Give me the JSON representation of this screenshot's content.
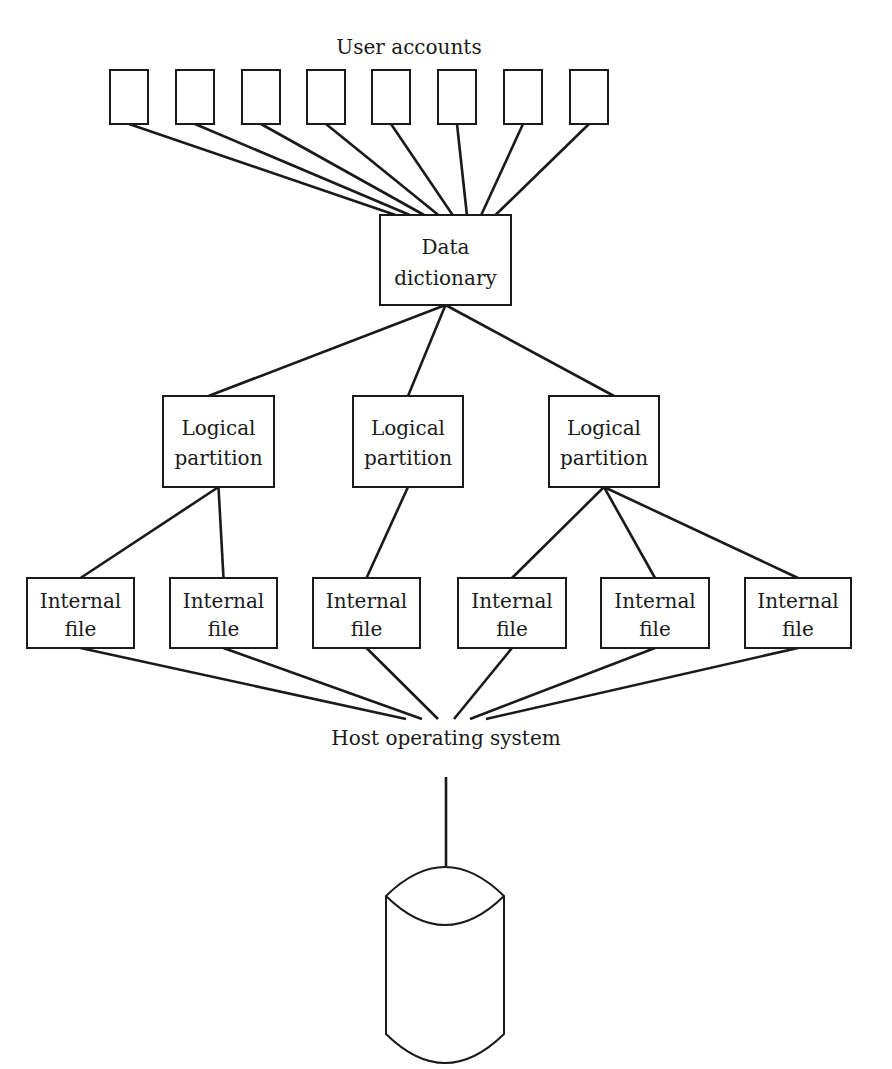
{
  "diagram": {
    "title": "User accounts",
    "user_accounts": {
      "label": "User accounts",
      "count": 8,
      "boxes": [
        {
          "x": 110,
          "y": 70,
          "w": 38,
          "h": 54
        },
        {
          "x": 176,
          "y": 70,
          "w": 38,
          "h": 54
        },
        {
          "x": 242,
          "y": 70,
          "w": 38,
          "h": 54
        },
        {
          "x": 307,
          "y": 70,
          "w": 38,
          "h": 54
        },
        {
          "x": 372,
          "y": 70,
          "w": 38,
          "h": 54
        },
        {
          "x": 438,
          "y": 70,
          "w": 38,
          "h": 54
        },
        {
          "x": 504,
          "y": 70,
          "w": 38,
          "h": 54
        },
        {
          "x": 570,
          "y": 70,
          "w": 38,
          "h": 54
        }
      ]
    },
    "data_dictionary": {
      "line1": "Data",
      "line2": "dictionary",
      "x": 380,
      "y": 215,
      "w": 131,
      "h": 90
    },
    "logical_partitions": [
      {
        "line1": "Logical",
        "line2": "partition",
        "x": 163,
        "y": 396,
        "w": 111,
        "h": 91
      },
      {
        "line1": "Logical",
        "line2": "partition",
        "x": 353,
        "y": 396,
        "w": 110,
        "h": 91
      },
      {
        "line1": "Logical",
        "line2": "partition",
        "x": 549,
        "y": 396,
        "w": 110,
        "h": 91
      }
    ],
    "internal_files": [
      {
        "line1": "Internal",
        "line2": "file",
        "x": 27,
        "y": 578,
        "w": 107,
        "h": 70,
        "parent": 0
      },
      {
        "line1": "Internal",
        "line2": "file",
        "x": 170,
        "y": 578,
        "w": 107,
        "h": 70,
        "parent": 0
      },
      {
        "line1": "Internal",
        "line2": "file",
        "x": 313,
        "y": 578,
        "w": 107,
        "h": 70,
        "parent": 1
      },
      {
        "line1": "Internal",
        "line2": "file",
        "x": 458,
        "y": 578,
        "w": 108,
        "h": 70,
        "parent": 2
      },
      {
        "line1": "Internal",
        "line2": "file",
        "x": 601,
        "y": 578,
        "w": 108,
        "h": 70,
        "parent": 2
      },
      {
        "line1": "Internal",
        "line2": "file",
        "x": 745,
        "y": 578,
        "w": 106,
        "h": 70,
        "parent": 2
      }
    ],
    "host_os": {
      "label": "Host operating system",
      "x": 446,
      "y": 745
    },
    "storage": {
      "name": "disk-storage-cylinder",
      "cx": 445,
      "top": 866,
      "bottom": 1064,
      "half_width": 59
    }
  }
}
